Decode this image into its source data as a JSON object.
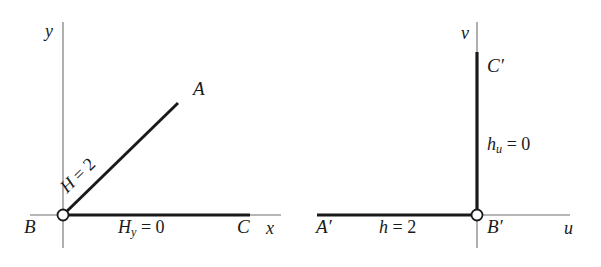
{
  "figure": {
    "background_color": "#ffffff",
    "ink_color": "#1a1a1a",
    "width": 601,
    "height": 267
  },
  "left_diagram": {
    "name": "physical-plane",
    "axes": {
      "vertical_label": "y",
      "horizontal_label": "x"
    },
    "points": {
      "origin": "B",
      "diagonal_end": "A",
      "horizontal_end": "C"
    },
    "annotations": {
      "diagonal": "H = 2",
      "diagonal_symbol": "H",
      "diagonal_value": "2",
      "horizontal": "H",
      "horizontal_subscript": "y",
      "horizontal_value": "0"
    },
    "geometry": {
      "origin": [
        63,
        215
      ],
      "diagonal_end": [
        178,
        103
      ],
      "horizontal_thick_end": [
        250,
        215
      ],
      "horizontal_thin_end": [
        281,
        215
      ],
      "horizontal_thin_start": [
        30,
        215
      ],
      "vertical_top": [
        63,
        22
      ],
      "vertical_bottom": [
        63,
        248
      ],
      "diagonal_angle_deg": 44.2
    }
  },
  "right_diagram": {
    "name": "transformed-plane",
    "axes": {
      "vertical_label": "v",
      "horizontal_label": "u"
    },
    "points": {
      "origin": "B′",
      "vertical_end": "C′",
      "horizontal_end": "A′"
    },
    "annotations": {
      "vertical": "h",
      "vertical_subscript": "u",
      "vertical_value": "0",
      "horizontal": "h = 2",
      "horizontal_symbol": "h",
      "horizontal_value": "2"
    },
    "geometry": {
      "origin": [
        477,
        215
      ],
      "vertical_thick_top": [
        477,
        52
      ],
      "vertical_thin_top": [
        477,
        22
      ],
      "vertical_thin_bottom": [
        477,
        248
      ],
      "horizontal_thick_start": [
        317,
        215
      ],
      "horizontal_thin_end": [
        570,
        215
      ]
    }
  },
  "markers": {
    "origin_style": "open-circle",
    "open_circle_radius": 5.5,
    "thick_stroke_width": 3.2,
    "thin_stroke_width": 1.1
  }
}
